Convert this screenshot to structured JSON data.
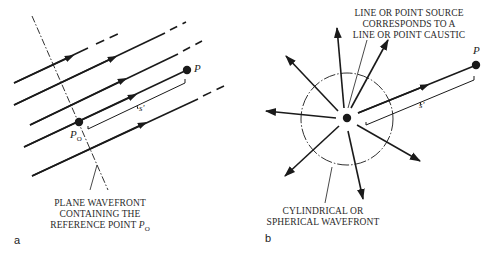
{
  "figure": {
    "panels": [
      {
        "id": "a",
        "label": "a",
        "title": "Plane wave rays",
        "point_labels": {
          "reference_point": "P",
          "reference_point_subscript": "O",
          "observation_point": "P",
          "distance": "s'"
        },
        "caption_lines": [
          "PLANE WAVEFRONT",
          "CONTAINING THE",
          "REFERENCE POINT "
        ],
        "caption_symbol": "P",
        "caption_symbol_subscript": "O"
      },
      {
        "id": "b",
        "label": "b",
        "title": "Cylindrical or spherical wave rays",
        "point_labels": {
          "observation_point": "P",
          "distance": "s'"
        },
        "top_caption_lines": [
          "LINE OR POINT SOURCE",
          "CORRESPONDS TO A",
          "LINE OR POINT CAUSTIC"
        ],
        "bottom_caption_lines": [
          "CYLINDRICAL OR",
          "SPHERICAL WAVEFRONT"
        ]
      }
    ],
    "colors": {
      "ink": "#1a1a1a",
      "background": "#ffffff"
    }
  }
}
